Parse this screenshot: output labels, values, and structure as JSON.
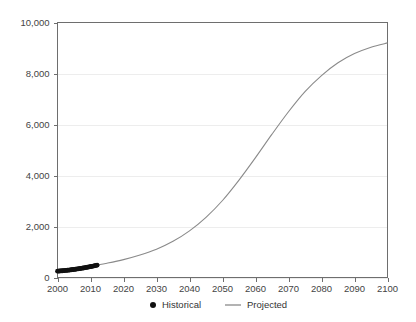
{
  "chart_data": {
    "type": "line",
    "title": "",
    "subtitle": "",
    "xlabel": "",
    "ylabel": "",
    "xlim": [
      2000,
      2100
    ],
    "ylim": [
      0,
      10000
    ],
    "grid": true,
    "legend_position": "bottom-center",
    "x_ticks": [
      2000,
      2010,
      2020,
      2030,
      2040,
      2050,
      2060,
      2070,
      2080,
      2090,
      2100
    ],
    "x_tick_labels": [
      "2000",
      "2010",
      "2020",
      "2030",
      "2040",
      "2050",
      "2060",
      "2070",
      "2080",
      "2090",
      "2100"
    ],
    "y_ticks": [
      0,
      2000,
      4000,
      6000,
      8000,
      10000
    ],
    "y_tick_labels": [
      "0",
      "2,000",
      "4,000",
      "6,000",
      "8,000",
      "10,000"
    ],
    "colors": {
      "historical": "#111111",
      "projected": "#8a8a8a",
      "grid": "#ededed",
      "axis": "#6e6e6e",
      "background": "#ffffff",
      "text": "#444444"
    },
    "series": [
      {
        "name": "Historical",
        "type": "scatter",
        "marker": "circle",
        "color": "#111111",
        "x": [
          2000.0,
          2000.3,
          2000.6,
          2000.9,
          2001.2,
          2001.5,
          2001.8,
          2002.1,
          2002.4,
          2002.7,
          2003.0,
          2003.3,
          2003.6,
          2003.9,
          2004.2,
          2004.5,
          2004.8,
          2005.1,
          2005.4,
          2005.7,
          2006.0,
          2006.3,
          2006.6,
          2006.9,
          2007.2,
          2007.5,
          2007.8,
          2008.1,
          2008.4,
          2008.7,
          2009.0,
          2009.3,
          2009.6,
          2009.9,
          2010.2,
          2010.5,
          2010.8,
          2011.1,
          2011.4,
          2011.7,
          2012.0
        ],
        "y": [
          250,
          252,
          255,
          258,
          262,
          265,
          268,
          272,
          276,
          280,
          285,
          289,
          293,
          298,
          303,
          308,
          313,
          318,
          324,
          329,
          335,
          341,
          347,
          353,
          360,
          366,
          373,
          380,
          387,
          394,
          401,
          409,
          416,
          424,
          432,
          440,
          449,
          457,
          466,
          475,
          484
        ]
      },
      {
        "name": "Projected",
        "type": "line",
        "color": "#8a8a8a",
        "x": [
          2012,
          2015,
          2020,
          2025,
          2030,
          2035,
          2040,
          2045,
          2050,
          2055,
          2060,
          2065,
          2070,
          2075,
          2080,
          2085,
          2090,
          2095,
          2100
        ],
        "y": [
          490,
          560,
          700,
          880,
          1110,
          1420,
          1830,
          2360,
          3020,
          3820,
          4700,
          5620,
          6500,
          7290,
          7920,
          8420,
          8780,
          9030,
          9200
        ]
      }
    ],
    "legend": [
      {
        "label": "Historical",
        "marker": "dot",
        "color": "#111111"
      },
      {
        "label": "Projected",
        "marker": "line",
        "color": "#8a8a8a"
      }
    ]
  }
}
